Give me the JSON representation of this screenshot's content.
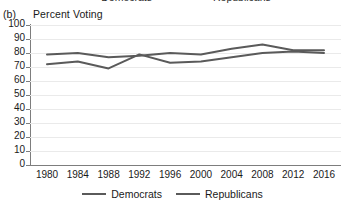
{
  "panel": {
    "label": "(b)",
    "axis_title": "Percent Voting"
  },
  "top_legend": {
    "items": [
      {
        "label": "Democrats",
        "color": "#5a5a5a"
      },
      {
        "label": "Republicans",
        "color": "#5a5a5a"
      }
    ]
  },
  "legend": {
    "items": [
      {
        "label": "Democrats",
        "color": "#5a5a5a"
      },
      {
        "label": "Republicans",
        "color": "#5a5a5a"
      }
    ]
  },
  "axes": {
    "y_ticks": [
      "100",
      "90",
      "80",
      "70",
      "60",
      "50",
      "40",
      "30",
      "20",
      "10",
      "0"
    ],
    "x_ticks": [
      "1980",
      "1984",
      "1988",
      "1992",
      "1996",
      "2000",
      "2004",
      "2008",
      "2012",
      "2016"
    ]
  },
  "chart_data": {
    "type": "line",
    "title": "Percent Voting",
    "xlabel": "",
    "ylabel": "Percent Voting",
    "ylim": [
      0,
      100
    ],
    "ytick_step": 10,
    "grid": true,
    "legend_position": "bottom",
    "categories": [
      "1980",
      "1984",
      "1988",
      "1992",
      "1996",
      "2000",
      "2004",
      "2008",
      "2012",
      "2016"
    ],
    "series": [
      {
        "name": "Democrats",
        "color": "#5a5a5a",
        "values": [
          72,
          74,
          69,
          79,
          73,
          74,
          77,
          80,
          81,
          80
        ]
      },
      {
        "name": "Republicans",
        "color": "#5a5a5a",
        "values": [
          79,
          80,
          77,
          78,
          80,
          79,
          83,
          86,
          82,
          82
        ]
      }
    ]
  }
}
